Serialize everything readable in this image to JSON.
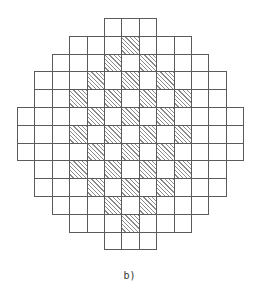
{
  "figure": {
    "caption": "b)",
    "grid": {
      "rows": 13,
      "cols": 13,
      "origin_x": 17,
      "origin_y": 18,
      "cell_w": 17.4,
      "cell_h": 17.8,
      "line_color": "#5a5a5a",
      "hatch_color": "#8a8a8a",
      "row_extents": [
        [
          5,
          7
        ],
        [
          3,
          9
        ],
        [
          2,
          10
        ],
        [
          1,
          11
        ],
        [
          1,
          11
        ],
        [
          0,
          12
        ],
        [
          0,
          12
        ],
        [
          0,
          12
        ],
        [
          1,
          11
        ],
        [
          1,
          11
        ],
        [
          2,
          10
        ],
        [
          3,
          9
        ],
        [
          5,
          7
        ]
      ],
      "shaded_cells": [
        [
          1,
          6
        ],
        [
          2,
          5
        ],
        [
          2,
          7
        ],
        [
          3,
          4
        ],
        [
          3,
          6
        ],
        [
          3,
          8
        ],
        [
          4,
          3
        ],
        [
          4,
          5
        ],
        [
          4,
          7
        ],
        [
          4,
          9
        ],
        [
          5,
          4
        ],
        [
          5,
          6
        ],
        [
          5,
          8
        ],
        [
          6,
          3
        ],
        [
          6,
          5
        ],
        [
          6,
          7
        ],
        [
          6,
          9
        ],
        [
          7,
          4
        ],
        [
          7,
          6
        ],
        [
          7,
          8
        ],
        [
          8,
          3
        ],
        [
          8,
          5
        ],
        [
          8,
          7
        ],
        [
          8,
          9
        ],
        [
          9,
          4
        ],
        [
          9,
          6
        ],
        [
          9,
          8
        ],
        [
          10,
          5
        ],
        [
          10,
          7
        ],
        [
          11,
          6
        ]
      ]
    }
  }
}
